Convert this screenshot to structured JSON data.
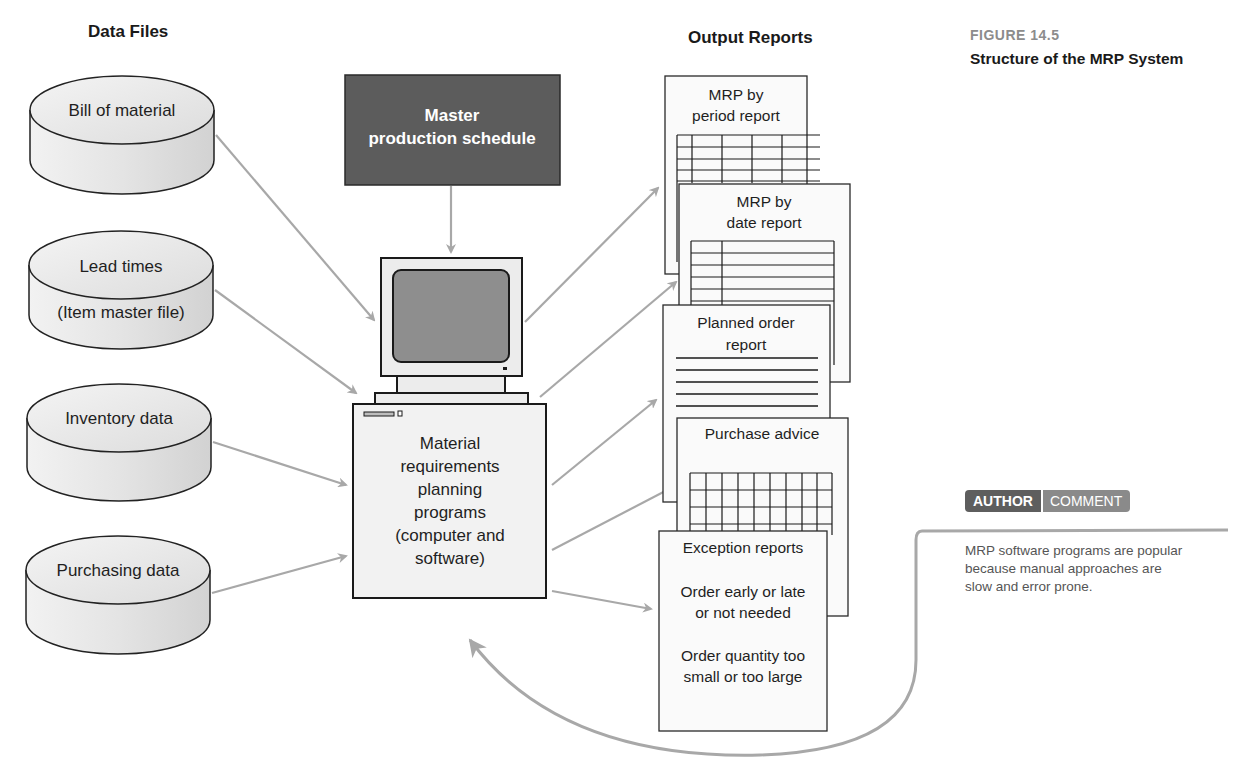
{
  "headers": {
    "data_files": "Data Files",
    "output_reports": "Output Reports"
  },
  "figure": {
    "number": "FIGURE 14.5",
    "caption": "Structure of the MRP System"
  },
  "data_files": [
    {
      "label": "Bill of material",
      "sublabel": ""
    },
    {
      "label": "Lead times",
      "sublabel": "(Item master file)"
    },
    {
      "label": "Inventory data",
      "sublabel": ""
    },
    {
      "label": "Purchasing data",
      "sublabel": ""
    }
  ],
  "master_schedule": {
    "line1": "Master",
    "line2": "production schedule"
  },
  "mrp_programs": {
    "lines": [
      "Material",
      "requirements",
      "planning",
      "programs",
      "(computer and",
      "software)"
    ]
  },
  "reports": [
    {
      "lines": [
        "MRP by",
        "period report"
      ]
    },
    {
      "lines": [
        "MRP by",
        "date report"
      ]
    },
    {
      "lines": [
        "Planned order",
        "report"
      ]
    },
    {
      "lines": [
        "Purchase advice"
      ]
    },
    {
      "lines": [
        "Exception reports",
        "",
        "Order early or late",
        "or not needed",
        "",
        "Order quantity too",
        "small or too large"
      ]
    }
  ],
  "author_comment": {
    "tag_author": "AUTHOR",
    "tag_comment": "COMMENT",
    "text_lines": [
      "MRP software programs are popular",
      "because manual approaches are",
      "slow and error prone."
    ]
  },
  "colors": {
    "arrow": "#a8a8a8",
    "mps_fill": "#5c5c5c",
    "screen_fill": "#8e8e8e",
    "cylinder_fill": "#e6e6e6",
    "outline": "#222222"
  }
}
